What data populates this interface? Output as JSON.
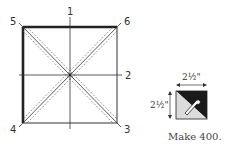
{
  "diagram": {
    "cutting_square": {
      "point_labels": [
        "1",
        "2",
        "3",
        "4",
        "5",
        "6"
      ],
      "description": "Square with center cross lines and two diagonals flanked by dashed seam lines; heavy edges on top and left"
    },
    "unit": {
      "width_label": "2½\"",
      "height_label": "2½\"",
      "colors": {
        "dark": "#1a1a1a",
        "light": "#d9d9d9"
      },
      "caption": "Make 400."
    }
  }
}
